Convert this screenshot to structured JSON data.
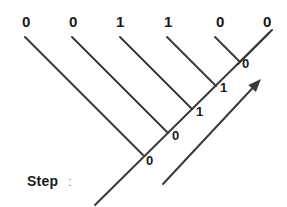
{
  "figure": {
    "type": "trellis-tree-diagram",
    "stroke_color": "#3a3a3a",
    "text_color": "#1a1a1a",
    "background": "#ffffff",
    "caption": {
      "text": "Step",
      "separator": ":"
    },
    "top_labels": [
      {
        "id": "t0",
        "value": "0",
        "x": 22,
        "y": 14
      },
      {
        "id": "t1",
        "value": "0",
        "x": 69,
        "y": 14
      },
      {
        "id": "t2",
        "value": "1",
        "x": 116,
        "y": 14
      },
      {
        "id": "t3",
        "value": "1",
        "x": 164,
        "y": 14
      },
      {
        "id": "t4",
        "value": "0",
        "x": 216,
        "y": 14
      },
      {
        "id": "t5",
        "value": "0",
        "x": 263,
        "y": 14
      }
    ],
    "node_labels": [
      {
        "id": "n0",
        "value": "0",
        "x": 242,
        "y": 57
      },
      {
        "id": "n1",
        "value": "1",
        "x": 220,
        "y": 81
      },
      {
        "id": "n2",
        "value": "1",
        "x": 196,
        "y": 105
      },
      {
        "id": "n3",
        "value": "0",
        "x": 172,
        "y": 129
      },
      {
        "id": "n4",
        "value": "0",
        "x": 146,
        "y": 154
      }
    ],
    "branches": [
      {
        "id": "b0",
        "x1": 25,
        "y1": 37,
        "x2": 143,
        "y2": 155
      },
      {
        "id": "b1",
        "x1": 72,
        "y1": 37,
        "x2": 168,
        "y2": 133
      },
      {
        "id": "b2",
        "x1": 120,
        "y1": 37,
        "x2": 192,
        "y2": 109
      },
      {
        "id": "b3",
        "x1": 167,
        "y1": 37,
        "x2": 216,
        "y2": 86
      },
      {
        "id": "b4",
        "x1": 215,
        "y1": 37,
        "x2": 240,
        "y2": 62
      },
      {
        "id": "b5",
        "x1": 269,
        "y1": 33,
        "x2": 238,
        "y2": 64
      }
    ],
    "spine": {
      "id": "spine",
      "x1": 95,
      "y1": 205,
      "x2": 272,
      "y2": 30
    },
    "arrow": {
      "id": "direction-arrow",
      "x1": 163,
      "y1": 184,
      "x2": 261,
      "y2": 79,
      "head_size": 13
    }
  }
}
